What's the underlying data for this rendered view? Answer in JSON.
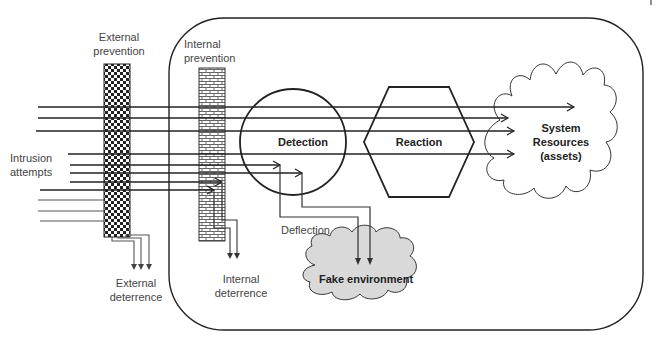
{
  "labels": {
    "external_prevention": [
      "External",
      "prevention"
    ],
    "internal_prevention": [
      "Internal",
      "prevention"
    ],
    "intrusion_attempts": [
      "Intrusion",
      "attempts"
    ],
    "detection": "Detection",
    "reaction": "Reaction",
    "system_resources": [
      "System",
      "Resources",
      "(assets)"
    ],
    "deflection": "Deflection",
    "fake_environment": "Fake environment",
    "external_deterrence": [
      "External",
      "deterrence"
    ],
    "internal_deterrence": [
      "Internal",
      "deterrence"
    ]
  },
  "colors": {
    "line": "#222222",
    "label_text": "#444444",
    "fake_env_fill": "#d9d9d9",
    "background": "#ffffff"
  }
}
